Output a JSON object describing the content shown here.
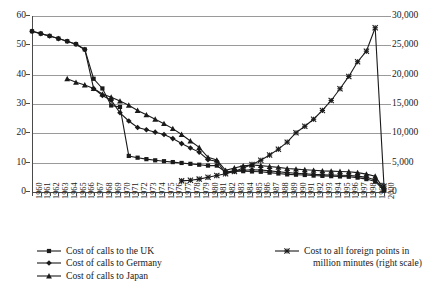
{
  "chart_data": {
    "type": "line",
    "title": "",
    "subtitle": "",
    "xlabel": "",
    "ylabel": "",
    "y2label": "",
    "grid": true,
    "legend_position": "bottom",
    "ylim": [
      0,
      60
    ],
    "y2lim": [
      0,
      30000
    ],
    "yticks": [
      "0",
      "10",
      "20",
      "30",
      "40",
      "50",
      "60"
    ],
    "y2ticks": [
      "0",
      "5,000",
      "10,000",
      "15,000",
      "20,000",
      "25,000",
      "30,000"
    ],
    "x": [
      "1960",
      "1961",
      "1962",
      "1963",
      "1964",
      "1965",
      "1966",
      "1967",
      "1968",
      "1969",
      "1970",
      "1971",
      "1972",
      "1973",
      "1974",
      "1975",
      "1976",
      "1977",
      "1978",
      "1979",
      "1980",
      "1981",
      "1982",
      "1983",
      "1984",
      "1985",
      "1986",
      "1987",
      "1988",
      "1989",
      "1990",
      "1991",
      "1992",
      "1993",
      "1994",
      "1995",
      "1996",
      "1997",
      "1998",
      "1999",
      "2000"
    ],
    "series": [
      {
        "name": "Cost of calls to the UK",
        "marker": "square",
        "axis": "left",
        "values": [
          54.8,
          54.0,
          53.2,
          52.3,
          51.4,
          50.4,
          48.6,
          38.6,
          35.3,
          29.5,
          29.0,
          12.3,
          11.7,
          11.2,
          10.8,
          10.5,
          10.2,
          9.9,
          9.6,
          9.3,
          9.0,
          9.0,
          6.8,
          7.2,
          7.1,
          7.0,
          6.9,
          6.6,
          6.3,
          6.0,
          5.9,
          5.8,
          5.6,
          5.5,
          5.4,
          5.3,
          5.2,
          4.9,
          4.4,
          3.6,
          0.5
        ]
      },
      {
        "name": "Cost of calls to Germany",
        "marker": "diamond",
        "axis": "left",
        "values": [
          54.8,
          54.0,
          53.2,
          52.3,
          51.4,
          50.4,
          48.6,
          35.3,
          32.9,
          31.3,
          27.0,
          24.2,
          22.0,
          21.2,
          20.4,
          19.6,
          18.2,
          16.5,
          15.0,
          13.6,
          11.0,
          10.5,
          6.4,
          7.0,
          7.4,
          7.6,
          7.5,
          7.2,
          6.9,
          6.6,
          6.4,
          6.2,
          6.0,
          5.9,
          5.8,
          5.7,
          5.6,
          5.4,
          5.0,
          4.1,
          0.8
        ]
      },
      {
        "name": "Cost of calls to Japan",
        "marker": "triangle",
        "axis": "left",
        "values": [
          null,
          null,
          null,
          null,
          38.6,
          37.4,
          36.5,
          35.3,
          33.4,
          32.3,
          31.0,
          29.6,
          27.8,
          26.3,
          24.8,
          23.3,
          21.6,
          19.6,
          17.4,
          15.2,
          11.8,
          10.9,
          7.4,
          8.2,
          8.9,
          9.2,
          9.0,
          8.7,
          8.4,
          8.0,
          7.8,
          7.6,
          7.4,
          7.2,
          7.1,
          7.0,
          6.9,
          6.6,
          6.1,
          5.4,
          1.0
        ]
      },
      {
        "name": "Cost to all foreign points in million minutes (right scale)",
        "marker": "cross",
        "axis": "right",
        "values": [
          null,
          null,
          null,
          null,
          null,
          null,
          null,
          null,
          null,
          null,
          null,
          null,
          null,
          null,
          null,
          null,
          null,
          1900,
          2000,
          2200,
          2500,
          2800,
          3100,
          3500,
          4100,
          4700,
          5400,
          6300,
          7300,
          8500,
          10100,
          11200,
          12400,
          13900,
          15600,
          17600,
          19700,
          22200,
          24000,
          28000,
          1000
        ]
      }
    ]
  },
  "legend": {
    "entries": [
      {
        "label": "Cost of calls to the UK",
        "marker": "square"
      },
      {
        "label": "Cost of calls to Germany",
        "marker": "diamond"
      },
      {
        "label": "Cost of calls to Japan",
        "marker": "triangle"
      },
      {
        "label_line1": "Cost to all foreign points in",
        "label_line2": "million minutes (right scale)",
        "marker": "cross"
      }
    ]
  },
  "colors": {
    "series": "#1a1a1a",
    "grid": "#9a9a9a",
    "axis": "#4a4a4a",
    "background": "#ffffff"
  }
}
